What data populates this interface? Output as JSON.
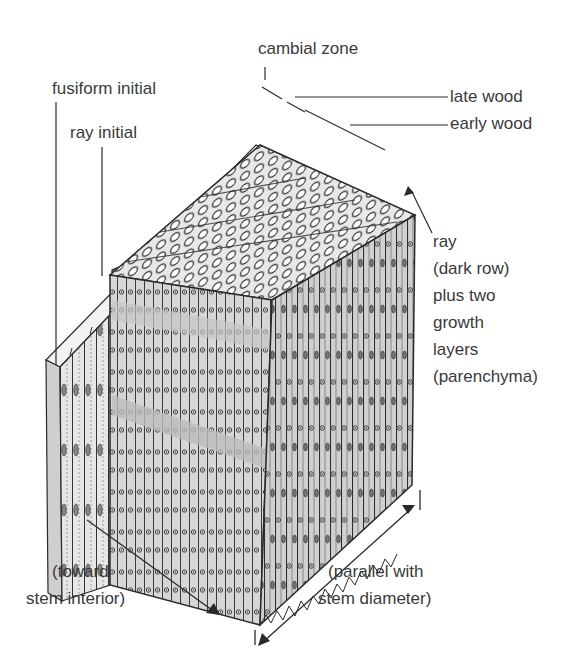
{
  "diagram": {
    "labels": {
      "cambial_zone": "cambial zone",
      "fusiform_initial": "fusiform initial",
      "ray_initial": "ray initial",
      "late_wood": "late wood",
      "early_wood": "early wood",
      "ray_note": [
        "ray",
        "(dark row)",
        "plus two",
        "growth",
        "layers",
        "(parenchyma)"
      ],
      "toward_interior": [
        "(toward",
        "stem interior)"
      ],
      "parallel_diameter": [
        "(parallel with",
        "stem diameter)"
      ]
    },
    "colors": {
      "ink": "#2a2a2a",
      "face_fill": "#d9d9d9",
      "top_fill": "#ececec",
      "text": "#3a3a3a",
      "background": "#ffffff"
    }
  }
}
